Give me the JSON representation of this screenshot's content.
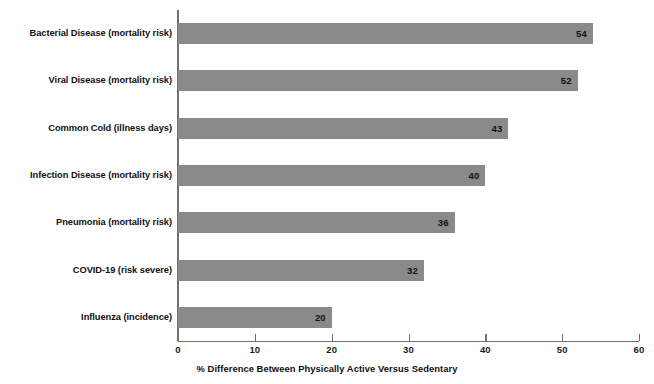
{
  "chart_data": {
    "type": "bar",
    "orientation": "horizontal",
    "title": "",
    "subtitle": "",
    "xlabel": "% Difference Between Physically Active Versus Sedentary",
    "ylabel": "",
    "categories": [
      "Bacterial Disease (mortality risk)",
      "Viral Disease (mortality risk)",
      "Common Cold (illness days)",
      "Infection Disease (mortality risk)",
      "Pneumonia (mortality risk)",
      "COVID-19 (risk severe)",
      "Influenza (incidence)"
    ],
    "values": [
      54,
      52,
      43,
      40,
      36,
      32,
      20
    ],
    "data_labels": [
      "54",
      "52",
      "43",
      "40",
      "36",
      "32",
      "20"
    ],
    "xlim": [
      0,
      60
    ],
    "xticks": [
      0,
      10,
      20,
      30,
      40,
      50,
      60
    ],
    "xtick_labels": [
      "0",
      "10",
      "20",
      "30",
      "40",
      "50",
      "60"
    ],
    "grid": false,
    "legend": false,
    "bar_color": "#8a8a8a",
    "axis_color": "#6f6f6f",
    "text_color": "#111111",
    "background_color": "#ffffff"
  }
}
